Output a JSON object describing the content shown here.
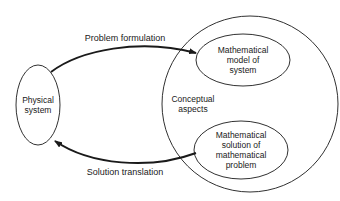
{
  "diagram": {
    "nodes": {
      "physical_system": {
        "label_line1": "Physical",
        "label_line2": "system"
      },
      "conceptual_aspects": {
        "label_line1": "Conceptual",
        "label_line2": "aspects"
      },
      "math_model": {
        "label_line1": "Mathematical",
        "label_line2": "model of",
        "label_line3": "system"
      },
      "math_solution": {
        "label_line1": "Mathematical",
        "label_line2": "solution of",
        "label_line3": "mathematical",
        "label_line4": "problem"
      }
    },
    "edges": {
      "problem_formulation": {
        "label": "Problem formulation",
        "from": "Physical system",
        "to": "Mathematical model of system"
      },
      "solution_translation": {
        "label": "Solution translation",
        "from": "Mathematical solution of mathematical problem",
        "to": "Physical system"
      }
    },
    "colors": {
      "stroke": "#1a1a1a",
      "background": "#ffffff"
    }
  }
}
